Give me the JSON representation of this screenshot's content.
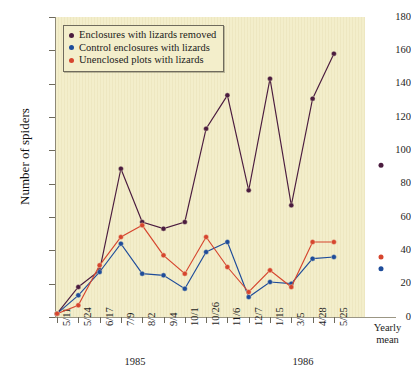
{
  "chart_data": {
    "type": "line",
    "title": "",
    "xlabel": "",
    "ylabel": "Number of spiders",
    "ylim": [
      0,
      180
    ],
    "yticks": [
      0,
      20,
      40,
      60,
      80,
      100,
      120,
      140,
      160,
      180
    ],
    "grid": false,
    "legend_position": "top-left",
    "categories": [
      "5/11",
      "5/24",
      "6/17",
      "7/9",
      "8/2",
      "9/4",
      "10/1",
      "10/26",
      "11/6",
      "12/7",
      "1/15",
      "3/5",
      "4/28",
      "5/25"
    ],
    "category_extra": "Yearly mean",
    "group_labels": [
      {
        "label": "1985",
        "spans": [
          "5/11",
          "12/7"
        ]
      },
      {
        "label": "1986",
        "spans": [
          "1/15",
          "5/25"
        ]
      }
    ],
    "series": [
      {
        "name": "Enclosures with lizards removed",
        "color": "#4b1c3f",
        "values": [
          2,
          18,
          28,
          89,
          57,
          53,
          57,
          113,
          133,
          76,
          143,
          67,
          131,
          158
        ],
        "yearly_mean": 91
      },
      {
        "name": "Control enclosures with lizards",
        "color": "#1e4c9a",
        "values": [
          2,
          13,
          27,
          44,
          26,
          25,
          17,
          39,
          45,
          12,
          21,
          20,
          35,
          36
        ],
        "yearly_mean": 29
      },
      {
        "name": "Unenclosed plots with lizards",
        "color": "#d6452e",
        "values": [
          2,
          7,
          31,
          48,
          55,
          37,
          26,
          48,
          30,
          15,
          28,
          18,
          45,
          45
        ],
        "yearly_mean": 36
      }
    ]
  },
  "axis": {
    "y_label": "Number of spiders",
    "y_tick_labels": [
      "0",
      "20",
      "40",
      "60",
      "80",
      "100",
      "120",
      "140",
      "160",
      "180"
    ],
    "x_tick_labels": [
      "5/11",
      "5/24",
      "6/17",
      "7/9",
      "8/2",
      "9/4",
      "10/1",
      "10/26",
      "11/6",
      "12/7",
      "1/15",
      "3/5",
      "4/28",
      "5/25"
    ],
    "x_group_labels": [
      "1985",
      "1986"
    ],
    "yearly_mean_line1": "Yearly",
    "yearly_mean_line2": "mean"
  },
  "legend": {
    "items": [
      {
        "label": "Enclosures with lizards removed",
        "color": "#4b1c3f"
      },
      {
        "label": "Control enclosures with lizards",
        "color": "#1e4c9a"
      },
      {
        "label": "Unenclosed plots with lizards",
        "color": "#d6452e"
      }
    ]
  },
  "colors": {
    "plot_background": "#f3eecb",
    "page_background": "#ffffff",
    "axis": "#8d8877",
    "series_purple": "#4b1c3f",
    "series_blue": "#1e4c9a",
    "series_red": "#d6452e"
  }
}
